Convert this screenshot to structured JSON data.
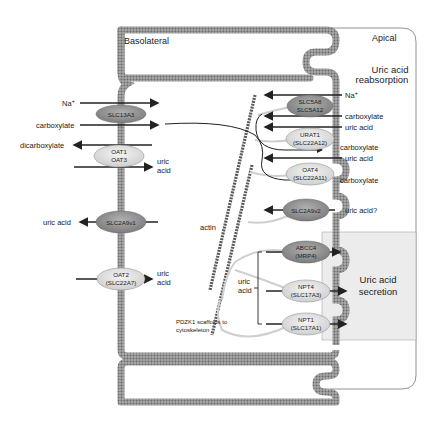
{
  "regions": {
    "basolateral": "Basolateral",
    "apical": "Apical",
    "reabsorption": [
      "Uric acid",
      "reabsorption"
    ],
    "secretion": [
      "Uric acid",
      "secretion"
    ]
  },
  "colors": {
    "membrane": "#8a8a8a",
    "transporter_dark": "#8c8c8c",
    "transporter_light": "#dcdcdc",
    "secretion_zone": "#ececec",
    "scaffold": "#cfcfcf",
    "actin": "#5a5a5a",
    "arrow": "#222222"
  },
  "basolateral_transporters": [
    {
      "id": "slc13a3",
      "lines": [
        "SLC13A3"
      ],
      "style": "dark"
    },
    {
      "id": "oat1-oat3",
      "lines": [
        "OAT1",
        "OAT3"
      ],
      "style": "light"
    },
    {
      "id": "slc2a9v1",
      "lines": [
        "SLC2A9v1"
      ],
      "style": "dark"
    },
    {
      "id": "oat2",
      "lines": [
        "OAT2",
        "(SLC22A7)"
      ],
      "style": "light"
    }
  ],
  "apical_transporters": [
    {
      "id": "slc5a8",
      "lines": [
        "SLC5A8",
        "SLC5A12"
      ],
      "style": "dark"
    },
    {
      "id": "urat1",
      "lines": [
        "URAT1",
        "(SLC22A12)"
      ],
      "style": "light"
    },
    {
      "id": "oat4",
      "lines": [
        "OAT4",
        "(SLC22A11)"
      ],
      "style": "light"
    },
    {
      "id": "slc2a9v2",
      "lines": [
        "SLC2A9v2"
      ],
      "style": "dark"
    },
    {
      "id": "abcc4",
      "lines": [
        "ABCC4",
        "(MRP4)"
      ],
      "style": "dark"
    },
    {
      "id": "npt4",
      "lines": [
        "NPT4",
        "(SLC17A3)"
      ],
      "style": "light"
    },
    {
      "id": "npt1",
      "lines": [
        "NPT1",
        "(SLC17A1)"
      ],
      "style": "light"
    }
  ],
  "basolateral_labels": {
    "na": "Na",
    "na_sup": "+",
    "carboxylate": "carboxylate",
    "dicarboxylate": "dicarboxylate",
    "uric_acid_1": [
      "uric",
      "acid"
    ],
    "uric_acid_2": "uric acid",
    "uric_acid_3": [
      "uric",
      "acid"
    ]
  },
  "apical_labels": {
    "na": "Na",
    "na_sup": "+",
    "carboxylate_1": "carboxylate",
    "uric_acid_1": "uric acid",
    "carboxylate_2": "carboxylate",
    "uric_acid_2": "uric acid",
    "carboxylate_3": "carboxylate",
    "uric_acid_q": "uric acid?"
  },
  "internal_labels": {
    "actin": "actin",
    "uric_acid": [
      "uric",
      "acid"
    ],
    "pdzk1": [
      "PDZK1 scaffolds to",
      "cytoskeleton"
    ]
  }
}
